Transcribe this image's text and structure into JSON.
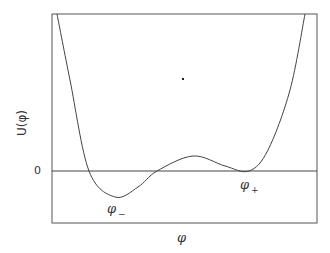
{
  "chart_data": {
    "type": "line",
    "title": "",
    "xlabel": "φ",
    "ylabel": "U(φ)",
    "yticks": [
      "0"
    ],
    "xticks": [],
    "grid": false,
    "legend": null,
    "annotations": [
      {
        "text": "φ",
        "subscript": "−",
        "meaning": "true vacuum (global minimum)"
      },
      {
        "text": "φ",
        "subscript": "+",
        "meaning": "false vacuum (local minimum at U=0)"
      }
    ],
    "series": [
      {
        "name": "U(φ)",
        "x": [
          0.02,
          0.14,
          0.24,
          0.4,
          0.53,
          0.67,
          0.74,
          0.83,
          0.95
        ],
        "y": [
          1.0,
          0.0,
          -0.17,
          0.0,
          0.1,
          0.02,
          0.0,
          0.2,
          1.0
        ]
      }
    ],
    "points_px": [
      [
        57,
        14
      ],
      [
        70,
        80
      ],
      [
        89,
        171
      ],
      [
        115,
        197
      ],
      [
        138,
        187
      ],
      [
        157,
        171
      ],
      [
        193,
        156
      ],
      [
        225,
        166
      ],
      [
        249,
        171
      ],
      [
        268,
        150
      ],
      [
        290,
        90
      ],
      [
        305,
        14
      ]
    ]
  },
  "labels": {
    "ylabel": "U(φ)",
    "zero_tick": "0",
    "phi_minus": "φ",
    "phi_minus_sub": "−",
    "phi_plus": "φ",
    "phi_plus_sub": "+",
    "xlabel": "φ"
  },
  "colors": {
    "line": "#444444",
    "frame": "#555555"
  }
}
